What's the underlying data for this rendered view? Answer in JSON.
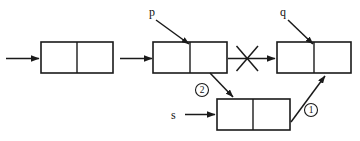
{
  "diagram": {
    "type": "linked-list-pointer-diagram",
    "background_color": "#ffffff",
    "stroke_color": "#1a1a1a",
    "nodes": [
      {
        "id": "node-head",
        "label": "",
        "x": 41,
        "y": 42,
        "w": 72,
        "h": 31
      },
      {
        "id": "node-p",
        "label": "",
        "x": 153,
        "y": 42,
        "w": 74,
        "h": 31
      },
      {
        "id": "node-q",
        "label": "",
        "x": 277,
        "y": 42,
        "w": 74,
        "h": 31
      },
      {
        "id": "node-s",
        "label": "",
        "x": 217,
        "y": 99,
        "w": 73,
        "h": 31
      }
    ],
    "pointer_labels": [
      {
        "id": "label-p",
        "text": "p",
        "x": 152,
        "y": 15
      },
      {
        "id": "label-q",
        "text": "q",
        "x": 283,
        "y": 15
      },
      {
        "id": "label-s",
        "text": "s",
        "x": 174,
        "y": 119
      }
    ],
    "step_markers": [
      {
        "id": "marker-1",
        "text": "1",
        "cx": 311,
        "cy": 110,
        "r": 6.5
      },
      {
        "id": "marker-2",
        "text": "2",
        "cx": 202,
        "cy": 90,
        "r": 6.5
      }
    ],
    "connections": [
      {
        "id": "arrow-entry",
        "from": "external",
        "to": "node-head",
        "style": "straight-horizontal"
      },
      {
        "id": "arrow-head-to-p",
        "from": "node-head",
        "to": "node-p",
        "style": "straight-horizontal"
      },
      {
        "id": "arrow-p-to-q",
        "from": "node-p",
        "to": "node-q",
        "style": "crossed-out"
      },
      {
        "id": "arrow-p-to-s",
        "from": "node-p",
        "to": "node-s",
        "style": "diagonal-down"
      },
      {
        "id": "arrow-s-to-q",
        "from": "node-s",
        "to": "node-q",
        "style": "diagonal-up"
      },
      {
        "id": "arrow-s-entry",
        "from": "label-s",
        "to": "node-s",
        "style": "straight-horizontal"
      },
      {
        "id": "pointer-p-arrow",
        "from": "label-p",
        "to": "node-p",
        "style": "diagonal-down"
      },
      {
        "id": "pointer-q-arrow",
        "from": "label-q",
        "to": "node-q",
        "style": "diagonal-down"
      }
    ]
  }
}
